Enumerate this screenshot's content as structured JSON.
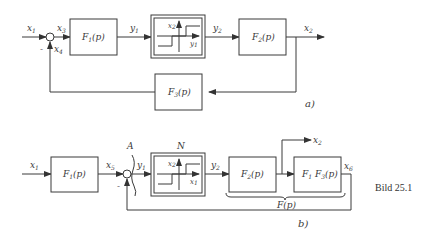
{
  "figure_a": {
    "label": "a)",
    "signals": {
      "x1": "x",
      "x1_sub": "1",
      "x3": "x",
      "x3_sub": "3",
      "x4": "x",
      "x4_sub": "4",
      "y1": "y",
      "y1_sub": "1",
      "y2": "y",
      "y2_sub": "2",
      "x2": "x",
      "x2_sub": "2"
    },
    "minus_sign": "-",
    "blocks": {
      "F1": "F",
      "F1_sub": "1",
      "F1_arg": "(p)",
      "F2": "F",
      "F2_sub": "2",
      "F2_arg": "(p)",
      "F3": "F",
      "F3_sub": "3",
      "F3_arg": "(p)"
    },
    "nonlinear": {
      "xaxis": "y",
      "xaxis_sub": "1",
      "yaxis": "x",
      "yaxis_sub": "2"
    }
  },
  "figure_b": {
    "label": "b)",
    "cut_label": "A",
    "nonlinear_label": "N",
    "signals": {
      "x1": "x",
      "x1_sub": "1",
      "x5": "x",
      "x5_sub": "5",
      "y1": "y",
      "y1_sub": "1",
      "y2": "y",
      "y2_sub": "2",
      "x2": "x",
      "x2_sub": "2",
      "x6": "x",
      "x6_sub": "6"
    },
    "minus_sign": "-",
    "blocks": {
      "F1": "F",
      "F1_sub": "1",
      "F1_arg": "(p)",
      "F2": "F",
      "F2_sub": "2",
      "F2_arg": "(p)",
      "F1F3": "F",
      "F1F3_sub1": "1",
      "F1F3_mid": " F",
      "F1F3_sub2": "3",
      "F1F3_arg": "(p)"
    },
    "nonlinear": {
      "xaxis": "x",
      "xaxis_sub": "1",
      "yaxis": "x",
      "yaxis_sub": "2"
    },
    "brace_label": "F(p)"
  },
  "caption": "Bild 25.1"
}
